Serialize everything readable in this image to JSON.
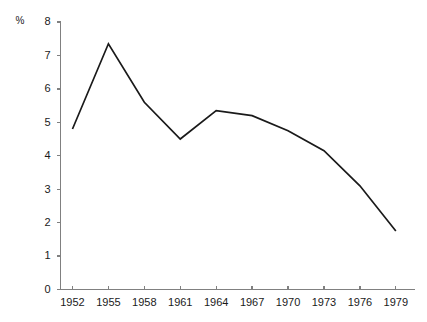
{
  "chart_data": {
    "type": "line",
    "title": "",
    "subtitle": "",
    "xlabel": "",
    "ylabel": "%",
    "unit_label": "%",
    "x": [
      1952,
      1955,
      1958,
      1961,
      1964,
      1967,
      1970,
      1973,
      1976,
      1979
    ],
    "categories": [
      "1952",
      "1955",
      "1958",
      "1961",
      "1964",
      "1967",
      "1970",
      "1973",
      "1976",
      "1979"
    ],
    "values": [
      4.8,
      7.35,
      5.6,
      4.5,
      5.35,
      5.2,
      4.75,
      4.15,
      3.1,
      1.75
    ],
    "series": [
      {
        "name": "",
        "values": [
          4.8,
          7.35,
          5.6,
          4.5,
          5.35,
          5.2,
          4.75,
          4.15,
          3.1,
          1.75
        ],
        "color": "#1a1a1a"
      }
    ],
    "xlim": [
      1951,
      1980.6
    ],
    "ylim": [
      0,
      8
    ],
    "y_ticks": [
      0,
      1,
      2,
      3,
      4,
      5,
      6,
      7,
      8
    ],
    "y_tick_labels": [
      "0",
      "1",
      "2",
      "3",
      "4",
      "5",
      "6",
      "7",
      "8"
    ],
    "x_ticks": [
      1952,
      1955,
      1958,
      1961,
      1964,
      1967,
      1970,
      1973,
      1976,
      1979
    ],
    "x_tick_labels": [
      "1952",
      "1955",
      "1958",
      "1961",
      "1964",
      "1967",
      "1970",
      "1973",
      "1976",
      "1979"
    ],
    "grid": false,
    "legend": null,
    "legend_position": "none",
    "annotations": [],
    "colors": {
      "line": "#1a1a1a",
      "axis": "#808080",
      "text": "#1a1a1a",
      "background": "#ffffff"
    }
  }
}
